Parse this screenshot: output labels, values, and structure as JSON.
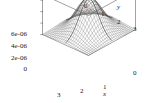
{
  "chart_data": {
    "type": "surface3d",
    "title": "",
    "xlabel": "x",
    "ylabel": "y",
    "zlabel": "",
    "xlim": [
      0,
      3
    ],
    "ylim": [
      0,
      3
    ],
    "zlim": [
      0,
      7e-06
    ],
    "grid": true,
    "legend": "none",
    "style": "wireframe-mesh",
    "surface_color": "#707070",
    "axis_color": "#555555",
    "x_ticks": [
      {
        "value": 0,
        "label": "0"
      },
      {
        "value": 1,
        "label": "1"
      },
      {
        "value": 2,
        "label": "2"
      },
      {
        "value": 3,
        "label": "3"
      }
    ],
    "y_ticks": [
      {
        "value": 0,
        "label": "0"
      },
      {
        "value": 1,
        "label": "1"
      },
      {
        "value": 2,
        "label": "2"
      },
      {
        "value": 3,
        "label": "3"
      }
    ],
    "z_ticks": [
      {
        "value": 0.0,
        "label": "0"
      },
      {
        "value": 2e-06,
        "label": "2e-06"
      },
      {
        "value": 4e-06,
        "label": "4e-06"
      },
      {
        "value": 6e-06,
        "label": "6e-06"
      }
    ],
    "surface": {
      "function": "gaussian",
      "peak_value": 6e-06,
      "peak_x": 1.5,
      "peak_y": 1.5,
      "sigma": 0.62,
      "mesh_n": 26
    }
  },
  "axes": {
    "x_axis_label": "x",
    "y_axis_label": "y",
    "x_tick_labels": [
      "3",
      "2",
      "1",
      "0"
    ],
    "y_tick_labels": [
      "0",
      "1",
      "2",
      "3"
    ],
    "z_tick_labels": [
      "6e-06",
      "4e-06",
      "2e-06",
      "0"
    ],
    "right_corner_label": "0"
  }
}
